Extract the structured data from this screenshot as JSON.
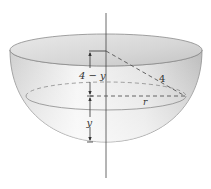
{
  "figure": {
    "labels": {
      "top_segment": "4 − y",
      "bottom_segment": "y",
      "hypotenuse": "4",
      "radius": "r"
    },
    "colors": {
      "stroke": "#555555",
      "dash": "#666666",
      "shade_dark": "#bdbdbd",
      "shade_light": "#f2f2f2",
      "background": "#ffffff"
    }
  }
}
